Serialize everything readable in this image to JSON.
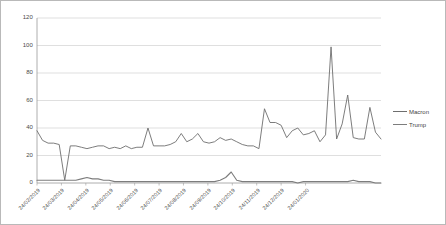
{
  "chart_data": {
    "type": "line",
    "title": "",
    "subtitle": "",
    "xlabel": "",
    "ylabel": "",
    "ylim": [
      0,
      120
    ],
    "yticks": [
      0,
      20,
      40,
      60,
      80,
      100,
      120
    ],
    "grid": true,
    "legend_position": "right",
    "x_tick_labels": [
      "24/02/2019",
      "24/03/2019",
      "24/04/2019",
      "24/05/2019",
      "24/06/2019",
      "24/07/2019",
      "24/08/2019",
      "24/09/2019",
      "24/10/2019",
      "24/11/2019",
      "24/12/2019",
      "24/01/2020"
    ],
    "x_tick_positions": [
      0,
      4.4,
      8.8,
      13.2,
      17.6,
      22.0,
      26.4,
      30.8,
      35.2,
      39.6,
      44.0,
      48.4
    ],
    "series": [
      {
        "name": "Macron",
        "color": "#6e6e6e",
        "values": [
          38,
          31,
          29,
          29,
          28,
          2,
          27,
          27,
          26,
          25,
          26,
          27,
          27,
          25,
          26,
          25,
          27,
          25,
          26,
          26,
          40,
          27,
          27,
          27,
          28,
          30,
          36,
          30,
          32,
          36,
          30,
          29,
          30,
          33,
          31,
          32,
          30,
          28,
          27,
          27,
          25,
          54,
          44,
          44,
          42,
          33,
          38,
          40,
          35,
          36,
          38,
          30,
          35,
          99,
          32,
          43,
          64,
          33,
          32,
          32,
          55,
          37,
          32
        ]
      },
      {
        "name": "Trump",
        "color": "#7d7d7d",
        "values": [
          2,
          2,
          2,
          2,
          2,
          2,
          2,
          2,
          3,
          4,
          3,
          3,
          2,
          2,
          1,
          1,
          1,
          1,
          1,
          1,
          1,
          1,
          1,
          1,
          1,
          1,
          1,
          1,
          1,
          1,
          1,
          1,
          1,
          2,
          4,
          8,
          2,
          1,
          1,
          1,
          1,
          1,
          1,
          1,
          1,
          1,
          1,
          0,
          1,
          1,
          1,
          1,
          1,
          1,
          1,
          1,
          1,
          2,
          1,
          1,
          1,
          0,
          0
        ]
      }
    ]
  },
  "legend": {
    "entries": [
      {
        "label": "Macron"
      },
      {
        "label": "Trump"
      }
    ]
  }
}
